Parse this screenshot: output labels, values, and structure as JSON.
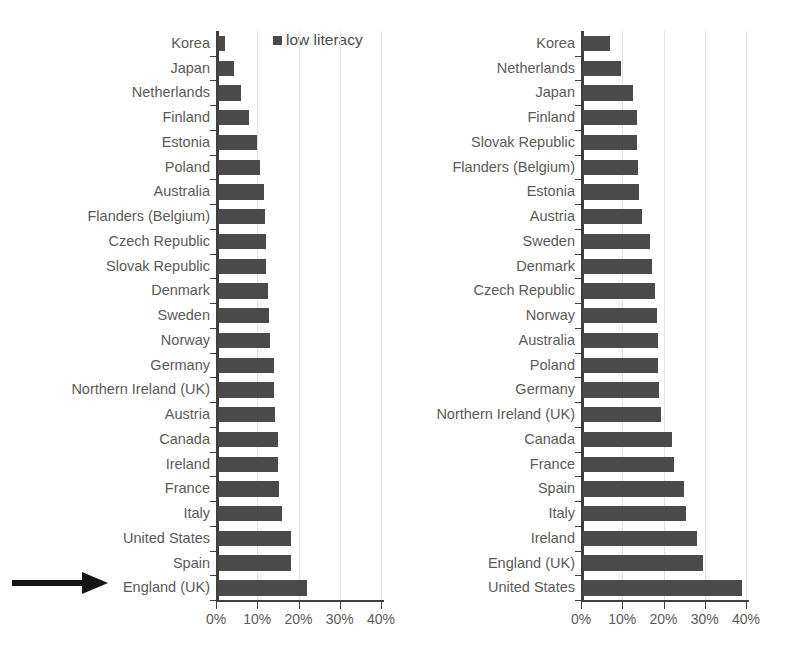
{
  "figure": {
    "background": "#ffffff",
    "bar_color": "#4a4a4a",
    "axis_color": "#3f3f3f",
    "grid_color": "#e2e2e2",
    "label_color": "#5a5a5a",
    "arrow_color": "#141414",
    "caption": ""
  },
  "chart_data": [
    {
      "type": "bar",
      "orientation": "horizontal",
      "title": "",
      "legend": [
        {
          "label": "low literacy",
          "marker": "square",
          "color": "#4a4a4a"
        }
      ],
      "legend_position": "top-right",
      "xlabel": "",
      "ylabel": "",
      "xlim": [
        0,
        40
      ],
      "xticks": [
        0,
        10,
        20,
        30,
        40
      ],
      "xticklabels": [
        "0%",
        "10%",
        "20%",
        "30%",
        "40%"
      ],
      "grid": true,
      "categories": [
        "Korea",
        "Japan",
        "Netherlands",
        "Finland",
        "Estonia",
        "Poland",
        "Australia",
        "Flanders (Belgium)",
        "Czech Republic",
        "Slovak Republic",
        "Denmark",
        "Sweden",
        "Norway",
        "Germany",
        "Northern Ireland (UK)",
        "Austria",
        "Canada",
        "Ireland",
        "France",
        "Italy",
        "United States",
        "Spain",
        "England (UK)"
      ],
      "values": [
        1.7,
        3.9,
        5.6,
        7.5,
        9.5,
        10.2,
        11.2,
        11.4,
        11.6,
        11.6,
        12.0,
        12.3,
        12.6,
        13.5,
        13.6,
        13.8,
        14.6,
        14.6,
        14.8,
        15.5,
        17.7,
        17.8,
        21.6
      ],
      "highlight": {
        "category": "England (UK)",
        "annotation": "arrow"
      }
    },
    {
      "type": "bar",
      "orientation": "horizontal",
      "title": "",
      "legend": [
        {
          "label": "low numeracy",
          "marker": "square",
          "color": "#4a4a4a"
        }
      ],
      "legend_position": "top-right",
      "xlabel": "",
      "ylabel": "",
      "xlim": [
        0,
        40
      ],
      "xticks": [
        0,
        10,
        20,
        30,
        40
      ],
      "xticklabels": [
        "0%",
        "10%",
        "20%",
        "30%",
        "40%"
      ],
      "grid": true,
      "categories": [
        "Korea",
        "Netherlands",
        "Japan",
        "Finland",
        "Slovak Republic",
        "Flanders (Belgium)",
        "Estonia",
        "Austria",
        "Sweden",
        "Denmark",
        "Czech Republic",
        "Norway",
        "Australia",
        "Poland",
        "Germany",
        "Northern Ireland (UK)",
        "Canada",
        "France",
        "Spain",
        "Italy",
        "Ireland",
        "England (UK)",
        "United States"
      ],
      "values": [
        6.5,
        9.2,
        12.1,
        13.1,
        13.1,
        13.3,
        13.6,
        14.3,
        16.2,
        16.8,
        17.5,
        18.0,
        18.1,
        18.2,
        18.4,
        19.0,
        21.5,
        22.0,
        24.4,
        25.0,
        27.7,
        29.0,
        38.6
      ],
      "highlight": {
        "category": "England (UK)",
        "annotation": "arrow"
      }
    }
  ]
}
